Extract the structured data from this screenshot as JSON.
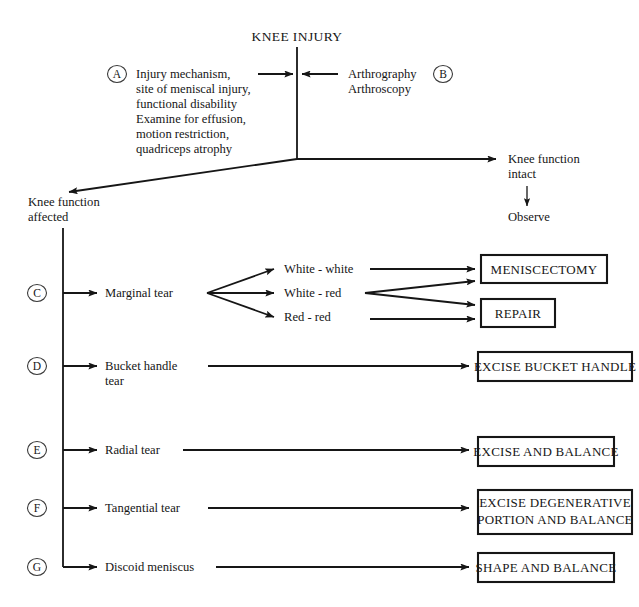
{
  "diagram": {
    "title": "KNEE INJURY",
    "root_node": {
      "label": "KNEE INJURY"
    },
    "inputs": {
      "left": {
        "marker": "A",
        "lines": [
          "Injury mechanism,",
          "site of meniscal injury,",
          "functional disability",
          "Examine for effusion,",
          "motion restriction,",
          "quadriceps atrophy"
        ]
      },
      "right": {
        "marker": "B",
        "lines": [
          "Arthrography",
          "Arthroscopy"
        ]
      }
    },
    "outcomes": {
      "intact": {
        "lines": [
          "Knee function",
          "intact"
        ],
        "action": "Observe"
      },
      "affected": {
        "lines": [
          "Knee function",
          "affected"
        ]
      }
    },
    "branches": [
      {
        "marker": "C",
        "lines": [
          "Marginal tear"
        ],
        "subnodes": [
          {
            "label": "White - white",
            "targets": [
              "MENISCECTOMY"
            ]
          },
          {
            "label": "White - red",
            "targets": [
              "MENISCECTOMY",
              "REPAIR"
            ]
          },
          {
            "label": "Red - red",
            "targets": [
              "REPAIR"
            ]
          }
        ],
        "treatments": [
          {
            "lines": [
              "MENISCECTOMY"
            ]
          },
          {
            "lines": [
              "REPAIR"
            ]
          }
        ]
      },
      {
        "marker": "D",
        "lines": [
          "Bucket handle",
          "tear"
        ],
        "subnodes": [],
        "treatments": [
          {
            "lines": [
              "EXCISE BUCKET HANDLE"
            ]
          }
        ]
      },
      {
        "marker": "E",
        "lines": [
          "Radial tear"
        ],
        "subnodes": [],
        "treatments": [
          {
            "lines": [
              "EXCISE AND BALANCE"
            ]
          }
        ]
      },
      {
        "marker": "F",
        "lines": [
          "Tangential tear"
        ],
        "subnodes": [],
        "treatments": [
          {
            "lines": [
              "EXCISE DEGENERATIVE",
              "PORTION AND BALANCE"
            ]
          }
        ]
      },
      {
        "marker": "G",
        "lines": [
          "Discoid meniscus"
        ],
        "subnodes": [],
        "treatments": [
          {
            "lines": [
              "SHAPE AND BALANCE"
            ]
          }
        ]
      }
    ],
    "colors": {
      "ink": "#161616",
      "background": "#ffffff"
    }
  }
}
